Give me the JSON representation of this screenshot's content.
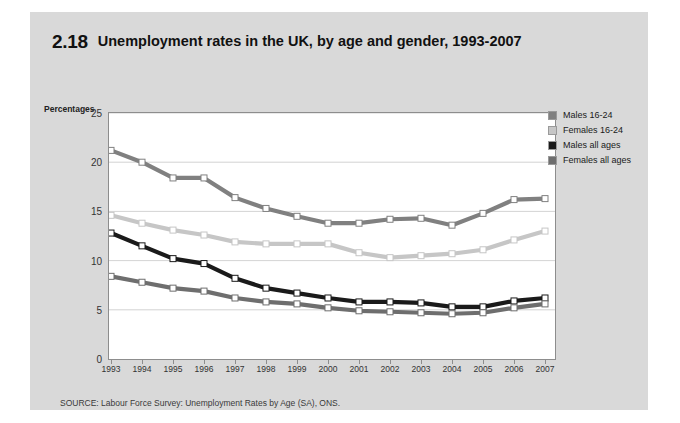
{
  "figure": {
    "number": "2.18",
    "title": "Unemployment rates in the UK, by age and gender, 1993-2007",
    "source": "SOURCE: Labour Force Survey: Unemployment Rates by Age (SA), ONS.",
    "panel_color": "#d9d9d9",
    "plot_background": "#ffffff"
  },
  "legend": {
    "position": "top-right",
    "items": [
      {
        "label": "Males 16-24",
        "color": "#808080"
      },
      {
        "label": "Females 16-24",
        "color": "#c6c6c6"
      },
      {
        "label": "Males all ages",
        "color": "#1a1a1a"
      },
      {
        "label": "Females all ages",
        "color": "#6e6e6e"
      }
    ]
  },
  "chart_data": {
    "type": "line",
    "title": "Unemployment rates in the UK, by age and gender, 1993-2007",
    "xlabel": "",
    "ylabel": "Percentages",
    "ylim": [
      0,
      25
    ],
    "yticks": [
      0,
      5,
      10,
      15,
      20,
      25
    ],
    "grid": true,
    "legend_position": "top-right",
    "categories": [
      "1993",
      "1994",
      "1995",
      "1996",
      "1997",
      "1998",
      "1999",
      "2000",
      "2001",
      "2002",
      "2003",
      "2004",
      "2005",
      "2006",
      "2007"
    ],
    "series": [
      {
        "name": "Males 16-24",
        "color": "#808080",
        "values": [
          21.2,
          20.0,
          18.4,
          18.4,
          16.4,
          15.3,
          14.5,
          13.8,
          13.8,
          14.2,
          14.3,
          13.6,
          14.8,
          16.2,
          16.3
        ]
      },
      {
        "name": "Females 16-24",
        "color": "#c6c6c6",
        "values": [
          14.6,
          13.8,
          13.1,
          12.6,
          11.9,
          11.7,
          11.7,
          11.7,
          10.8,
          10.3,
          10.5,
          10.7,
          11.1,
          12.1,
          13.0
        ]
      },
      {
        "name": "Males all ages",
        "color": "#1a1a1a",
        "values": [
          12.8,
          11.5,
          10.2,
          9.7,
          8.2,
          7.2,
          6.7,
          6.2,
          5.8,
          5.8,
          5.7,
          5.3,
          5.3,
          5.9,
          6.2
        ]
      },
      {
        "name": "Females all ages",
        "color": "#6e6e6e",
        "values": [
          8.4,
          7.8,
          7.2,
          6.9,
          6.2,
          5.8,
          5.6,
          5.2,
          4.9,
          4.8,
          4.7,
          4.6,
          4.7,
          5.2,
          5.6
        ]
      }
    ]
  }
}
